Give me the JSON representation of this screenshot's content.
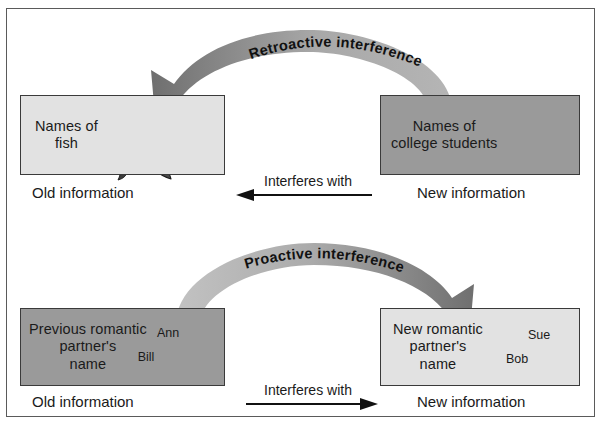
{
  "diagram": {
    "frame": {
      "border_color": "#5a5a5a"
    },
    "colors": {
      "box_light": "#e2e2e2",
      "box_dark": "#9a9a9a",
      "arrow_gray": "#9e9e9e",
      "arrow_gray_dark": "#7d7d7d",
      "text": "#1a1a1a",
      "line": "#111111"
    },
    "rows": [
      {
        "id": "retroactive",
        "arc_label": "Retroactive interference",
        "arc_direction": "right-to-left",
        "left_box": {
          "label": "Names of\nfish",
          "fill": "light",
          "art": "fish-icon"
        },
        "right_box": {
          "label": "Names of\ncollege students",
          "fill": "dark",
          "art": "college-students-icon"
        },
        "left_caption": "Old information",
        "right_caption": "New information",
        "middle_label": "Interferes with",
        "middle_arrow_direction": "left"
      },
      {
        "id": "proactive",
        "arc_label": "Proactive interference",
        "arc_direction": "left-to-right",
        "left_box": {
          "label": "Previous romantic\npartner's\nname",
          "fill": "dark",
          "hearts": [
            {
              "name": "Ann",
              "position": "upper-right"
            },
            {
              "name": "Bill",
              "position": "lower-left"
            }
          ]
        },
        "right_box": {
          "label": "New romantic\npartner's\nname",
          "fill": "light",
          "hearts": [
            {
              "name": "Sue",
              "position": "upper-right"
            },
            {
              "name": "Bob",
              "position": "lower-left"
            }
          ]
        },
        "left_caption": "Old information",
        "right_caption": "New information",
        "middle_label": "Interferes with",
        "middle_arrow_direction": "right"
      }
    ]
  }
}
